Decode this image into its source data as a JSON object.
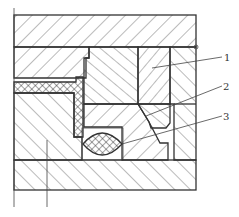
{
  "drawing": {
    "type": "mechanical cross-section",
    "callouts": [
      {
        "number": "1",
        "label": "1"
      },
      {
        "number": "2",
        "label": "2"
      },
      {
        "number": "3",
        "label": "3"
      }
    ],
    "colors": {
      "line": "#333333",
      "background": "#ffffff"
    }
  }
}
